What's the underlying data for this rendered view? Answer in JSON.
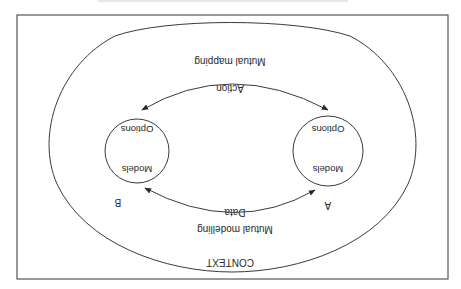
{
  "diagram": {
    "orientation": "rotated 180 degrees (upside-down)",
    "context_label": "CONTEXT",
    "nodes": [
      {
        "id": "A",
        "label": "A",
        "inner_top": "Models",
        "inner_bottom": "Options"
      },
      {
        "id": "B",
        "label": "B",
        "inner_top": "Models",
        "inner_bottom": "Options"
      }
    ],
    "edges": {
      "data": {
        "label": "Data",
        "caption": "Mutual modelling",
        "direction": "bidirectional"
      },
      "action": {
        "label": "Action",
        "caption": "Mutual mapping",
        "direction": "bidirectional"
      }
    }
  },
  "colors": {
    "line": "#3a3a3a",
    "text": "#2a2a2a",
    "background": "#ffffff"
  }
}
